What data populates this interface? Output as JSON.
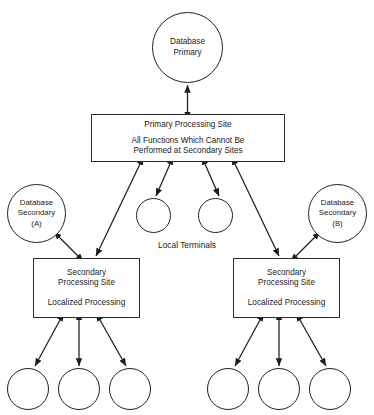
{
  "diagram": {
    "style": {
      "background": "#ffffff",
      "stroke": "#232323",
      "text": "#1a1a1a"
    },
    "nodes": {
      "database_primary": {
        "shape": "circle",
        "line1": "Database",
        "line2": "Primary"
      },
      "database_secondary_a": {
        "shape": "circle",
        "line1": "Database",
        "line2": "Secondary",
        "line3": "(A)"
      },
      "database_secondary_b": {
        "shape": "circle",
        "line1": "Database",
        "line2": "Secondary",
        "line3": "(B)"
      },
      "primary_processing_site": {
        "shape": "rectangle",
        "title": "Primary Processing Site",
        "detail_line1": "All Functions Which Cannot Be",
        "detail_line2": "Performed at Secondary Sites"
      },
      "secondary_processing_site_left": {
        "shape": "rectangle",
        "title_line1": "Secondary",
        "title_line2": "Processing Site",
        "detail": "Localized Processing"
      },
      "secondary_processing_site_right": {
        "shape": "rectangle",
        "title_line1": "Secondary",
        "title_line2": "Processing Site",
        "detail": "Localized Processing"
      }
    },
    "labels": {
      "local_terminals": "Local Terminals"
    },
    "terminals": {
      "middle_count": 2,
      "left_group_count": 3,
      "right_group_count": 3
    },
    "connections": [
      {
        "from": "primary_processing_site",
        "to": "database_primary",
        "type": "bidirectional"
      },
      {
        "from": "primary_processing_site",
        "to": "local_terminal_mid_1",
        "type": "bidirectional"
      },
      {
        "from": "primary_processing_site",
        "to": "local_terminal_mid_2",
        "type": "bidirectional"
      },
      {
        "from": "primary_processing_site",
        "to": "secondary_processing_site_left",
        "type": "bidirectional"
      },
      {
        "from": "primary_processing_site",
        "to": "secondary_processing_site_right",
        "type": "bidirectional"
      },
      {
        "from": "secondary_processing_site_left",
        "to": "database_secondary_a",
        "type": "bidirectional"
      },
      {
        "from": "secondary_processing_site_right",
        "to": "database_secondary_b",
        "type": "bidirectional"
      },
      {
        "from": "secondary_processing_site_left",
        "to": "terminal_left_1",
        "type": "bidirectional"
      },
      {
        "from": "secondary_processing_site_left",
        "to": "terminal_left_2",
        "type": "bidirectional"
      },
      {
        "from": "secondary_processing_site_left",
        "to": "terminal_left_3",
        "type": "bidirectional"
      },
      {
        "from": "secondary_processing_site_right",
        "to": "terminal_right_1",
        "type": "bidirectional"
      },
      {
        "from": "secondary_processing_site_right",
        "to": "terminal_right_2",
        "type": "bidirectional"
      },
      {
        "from": "secondary_processing_site_right",
        "to": "terminal_right_3",
        "type": "bidirectional"
      }
    ]
  }
}
